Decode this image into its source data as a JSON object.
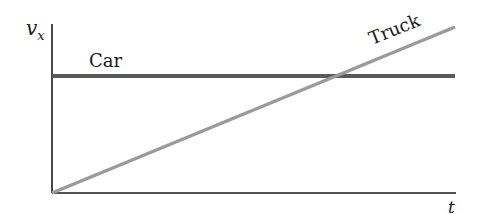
{
  "diagram": {
    "type": "velocity-time graph",
    "y_axis_label": "v",
    "y_axis_subscript": "x",
    "x_axis_label": "t",
    "series": [
      {
        "name": "Car",
        "label": "Car",
        "shape": "horizontal line",
        "color": "#5a5a5a"
      },
      {
        "name": "Truck",
        "label": "Truck",
        "shape": "line rising from origin",
        "color": "#9a9a9a"
      }
    ],
    "axis_color": "#1a1a1a"
  }
}
